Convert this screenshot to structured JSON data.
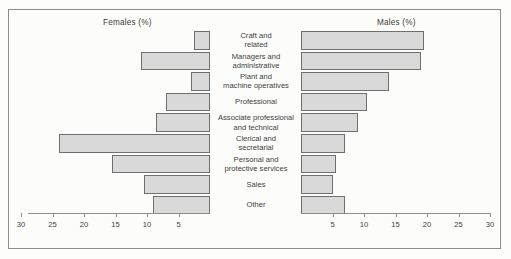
{
  "titles": {
    "females": "Females (%)",
    "males": "Males (%)"
  },
  "chart_data": {
    "type": "bar",
    "subtype": "population-pyramid",
    "title": "",
    "xlabel": "",
    "ylabel": "",
    "xlim": [
      0,
      30
    ],
    "grid": false,
    "legend": "none",
    "axis_ticks": [
      5,
      10,
      15,
      20,
      25,
      30
    ],
    "female_axis_ticks": [
      30,
      25,
      20,
      15,
      10,
      5
    ],
    "male_axis_ticks": [
      5,
      10,
      15,
      20,
      25,
      30
    ],
    "bar_fill_color": "#d9d9d9",
    "bar_border_color": "#6f6f6f",
    "categories": [
      "Craft and related",
      "Managers and administrative",
      "Plant and machine operatives",
      "Professional",
      "Associate professional and technical",
      "Clerical and secretarial",
      "Personal and protective services",
      "Sales",
      "Other"
    ],
    "category_lines": [
      [
        "Craft and",
        "related"
      ],
      [
        "Managers and",
        "administrative"
      ],
      [
        "Plant and",
        "machine operatives"
      ],
      [
        "Professional"
      ],
      [
        "Associate professional",
        "and technical"
      ],
      [
        "Clerical and",
        "secretarial"
      ],
      [
        "Personal and",
        "protective services"
      ],
      [
        "Sales"
      ],
      [
        "Other"
      ]
    ],
    "series": [
      {
        "name": "Females (%)",
        "direction": "left",
        "values": [
          2.5,
          11,
          3,
          7,
          8.5,
          24,
          15.5,
          10.5,
          9
        ]
      },
      {
        "name": "Males (%)",
        "direction": "right",
        "values": [
          19.5,
          19,
          14,
          10.5,
          9,
          7,
          5.5,
          5,
          7
        ]
      }
    ]
  }
}
